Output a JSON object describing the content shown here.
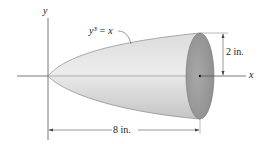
{
  "figure": {
    "curve_label": "y³ = x",
    "axis_x_label": "x",
    "axis_y_label": "y",
    "radius_dimension": "2 in.",
    "length_dimension": "8 in.",
    "colors": {
      "body_light": "#e6e6e6",
      "body_dark": "#bdbdbd",
      "end_face": "#9a9a9a",
      "lines": "#555555"
    }
  }
}
